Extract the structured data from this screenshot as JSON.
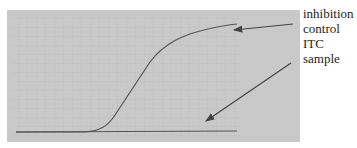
{
  "figure": {
    "background_panel_color": "#c9c9c9",
    "line_color": "#555555",
    "labels": [
      {
        "id": "inhibition",
        "text": "inhibition"
      },
      {
        "id": "control",
        "text": "control"
      },
      {
        "id": "itc",
        "text": "ITC"
      },
      {
        "id": "sample",
        "text": "sample"
      }
    ],
    "annotations": [
      {
        "label": "inhibition control",
        "points_to": "upper sigmoid curve"
      },
      {
        "label": "ITC sample",
        "points_to": "flat baseline curve"
      }
    ]
  }
}
